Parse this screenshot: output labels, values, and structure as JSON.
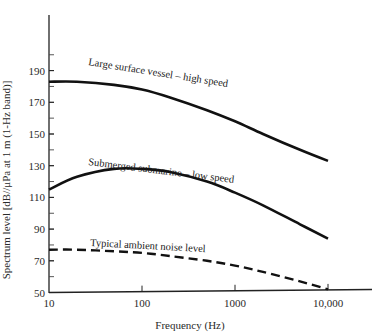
{
  "chart_data": {
    "type": "line",
    "title": "",
    "xlabel": "Frequency (Hz)",
    "ylabel": "Spectrum level [dB//μPa at 1 m (1-Hz band)]",
    "x_scale": "log",
    "xlim": [
      10,
      10000
    ],
    "ylim": [
      50,
      210
    ],
    "x_ticks": [
      10,
      100,
      1000,
      10000
    ],
    "x_tick_labels": [
      "10",
      "100",
      "1000",
      "10,000"
    ],
    "y_ticks": [
      50,
      70,
      90,
      110,
      130,
      150,
      170,
      190
    ],
    "y_tick_labels": [
      "50",
      "70",
      "90",
      "110",
      "130",
      "150",
      "170",
      "190"
    ],
    "y_minor_tick_step": 10,
    "grid": false,
    "legend": "inline labels on curves",
    "series": [
      {
        "name": "Large surface vessel – high speed",
        "style": "solid",
        "x": [
          10,
          20,
          50,
          100,
          200,
          500,
          1000,
          2000,
          5000,
          10000
        ],
        "y": [
          183,
          183,
          181,
          178,
          173,
          165,
          158,
          150,
          140,
          133
        ]
      },
      {
        "name": "Submerged submarine – low speed",
        "style": "solid",
        "x": [
          10,
          20,
          50,
          100,
          200,
          500,
          1000,
          2000,
          5000,
          10000
        ],
        "y": [
          115,
          123,
          128,
          128,
          126,
          120,
          113,
          105,
          93,
          84
        ]
      },
      {
        "name": "Typical ambient noise level",
        "style": "dashed",
        "x": [
          10,
          20,
          50,
          100,
          200,
          500,
          1000,
          2000,
          5000,
          10000
        ],
        "y": [
          77,
          77,
          76,
          75,
          73,
          70,
          67,
          63,
          57,
          52
        ]
      }
    ]
  }
}
